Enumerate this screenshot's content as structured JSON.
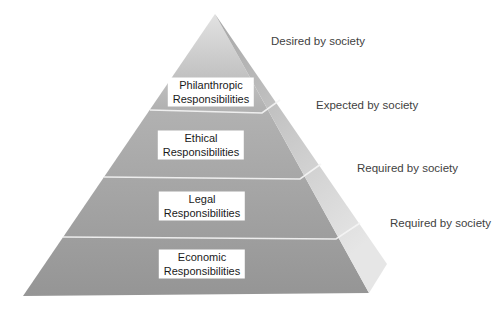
{
  "diagram": {
    "type": "pyramid",
    "levels": [
      {
        "id": "philanthropic",
        "label": "Philanthropic\nResponsibilities",
        "annotation": "Desired by society"
      },
      {
        "id": "ethical",
        "label": "Ethical\nResponsibilities",
        "annotation": "Expected by society"
      },
      {
        "id": "legal",
        "label": "Legal\nResponsibilities",
        "annotation": "Required by society"
      },
      {
        "id": "economic",
        "label": "Economic\nResponsibilities",
        "annotation": "Required by society"
      }
    ],
    "colors": {
      "background": "#ffffff",
      "front_face_top": "#e2e2e2",
      "front_face_mid": "#b2b2b2",
      "front_face_bottom": "#959595",
      "side_face_top": "#a6a6a6",
      "side_face_bottom": "#e6e6e6",
      "divider_line": "#f5f5f5",
      "label_background": "#ffffff",
      "label_text": "#1a1a1a",
      "annotation_text": "#3f3f3f"
    }
  }
}
